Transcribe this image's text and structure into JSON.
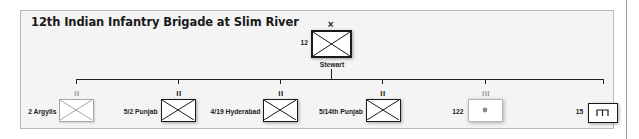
{
  "title": "12th Indian Infantry Brigade at Slim River",
  "colors": {
    "frame_bg": "#f4f4f4",
    "frame_border": "#b8b8b8",
    "symbol_dark": "#1a1a1a",
    "symbol_faded": "#9a9a9a"
  },
  "hq": {
    "designation": "12",
    "echelon": "×",
    "commander": "Stewart",
    "symbol": "infantry"
  },
  "units": [
    {
      "label": "2 Argylls",
      "echelon": "II",
      "symbol": "infantry",
      "style": "faded"
    },
    {
      "label": "5/2 Punjab",
      "echelon": "II",
      "symbol": "infantry",
      "style": "solid"
    },
    {
      "label": "4/19 Hyderabad",
      "echelon": "II",
      "symbol": "infantry",
      "style": "solid"
    },
    {
      "label": "5/14th Punjab",
      "echelon": "II",
      "symbol": "infantry",
      "style": "solid"
    },
    {
      "label": "122",
      "echelon": "III",
      "symbol": "artillery",
      "style": "faded"
    },
    {
      "label": "15",
      "echelon": "",
      "symbol": "engineer",
      "style": "solid"
    }
  ]
}
